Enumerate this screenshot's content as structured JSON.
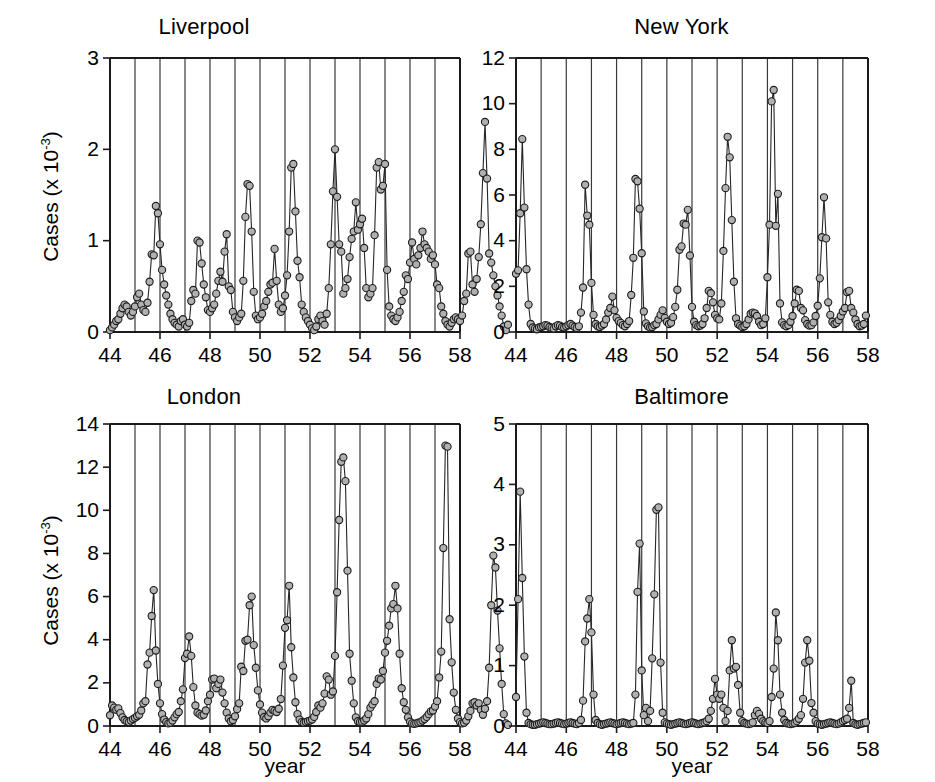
{
  "figure": {
    "background": "#ffffff",
    "marker_fill": "#b0b0b0",
    "marker_stroke": "#1c1c1c",
    "line_color": "#262626",
    "grid_color": "#3a3a3a"
  },
  "panels": [
    {
      "key": "liverpool",
      "title": "Liverpool",
      "ylabel_main": "Cases (x 10",
      "ylabel_exp": "-3",
      "ylabel_tail": ")",
      "xlabel": "",
      "show_ylabel": true,
      "show_xlabel": false
    },
    {
      "key": "newyork",
      "title": "New York",
      "ylabel_main": "",
      "ylabel_exp": "",
      "ylabel_tail": "",
      "xlabel": "",
      "show_ylabel": false,
      "show_xlabel": false
    },
    {
      "key": "london",
      "title": "London",
      "ylabel_main": "Cases (x 10",
      "ylabel_exp": "-3",
      "ylabel_tail": ")",
      "xlabel": "year",
      "show_ylabel": true,
      "show_xlabel": true
    },
    {
      "key": "baltimore",
      "title": "Baltimore",
      "ylabel_main": "",
      "ylabel_exp": "",
      "ylabel_tail": "",
      "xlabel": "year",
      "show_ylabel": false,
      "show_xlabel": true
    }
  ],
  "chart_data": [
    {
      "type": "line",
      "title": "Liverpool",
      "xlabel": "year",
      "ylabel": "Cases (x 10^-3)",
      "xlim": [
        44,
        58
      ],
      "ylim": [
        0,
        3
      ],
      "yticks": [
        0,
        1,
        2,
        3
      ],
      "xticks": [
        44,
        46,
        48,
        50,
        52,
        54,
        56,
        58
      ],
      "grid": "vertical gridlines at every year 44..58",
      "marker": "filled gray circle with dark outline",
      "x_start": 44.0,
      "x_step": 0.0833333,
      "values": [
        0.02,
        0.05,
        0.08,
        0.12,
        0.14,
        0.2,
        0.26,
        0.3,
        0.28,
        0.22,
        0.18,
        0.22,
        0.28,
        0.38,
        0.42,
        0.3,
        0.24,
        0.22,
        0.32,
        0.55,
        0.85,
        0.84,
        1.38,
        1.3,
        0.96,
        0.68,
        0.52,
        0.4,
        0.3,
        0.2,
        0.14,
        0.1,
        0.08,
        0.06,
        0.12,
        0.14,
        0.08,
        0.06,
        0.1,
        0.34,
        0.46,
        0.42,
        1.0,
        0.98,
        0.75,
        0.52,
        0.38,
        0.24,
        0.22,
        0.26,
        0.3,
        0.42,
        0.56,
        0.66,
        0.55,
        0.88,
        1.07,
        0.5,
        0.46,
        0.22,
        0.16,
        0.12,
        0.16,
        0.2,
        0.56,
        1.26,
        1.62,
        1.6,
        1.1,
        0.44,
        0.18,
        0.14,
        0.16,
        0.2,
        0.28,
        0.34,
        0.44,
        0.52,
        0.54,
        0.91,
        0.56,
        0.3,
        0.22,
        0.26,
        0.4,
        0.62,
        1.1,
        1.8,
        1.84,
        1.32,
        0.78,
        0.6,
        0.3,
        0.22,
        0.16,
        0.12,
        0.08,
        0.04,
        0.02,
        0.06,
        0.14,
        0.18,
        0.12,
        0.08,
        0.2,
        0.48,
        0.96,
        1.54,
        2.0,
        1.48,
        0.96,
        0.88,
        0.42,
        0.48,
        0.58,
        0.82,
        1.02,
        1.1,
        1.42,
        1.12,
        1.18,
        1.24,
        0.92,
        0.48,
        0.38,
        0.42,
        0.48,
        1.06,
        1.8,
        1.86,
        1.56,
        1.6,
        1.84,
        0.68,
        0.28,
        0.18,
        0.14,
        0.12,
        0.16,
        0.22,
        0.34,
        0.44,
        0.62,
        0.58,
        0.76,
        0.98,
        0.8,
        0.74,
        0.84,
        0.92,
        1.1,
        0.96,
        0.92,
        0.88,
        0.8,
        0.84,
        0.74,
        0.52,
        0.48,
        0.28,
        0.2,
        0.12,
        0.08,
        0.06,
        0.1,
        0.14,
        0.16,
        0.14,
        0.12,
        0.18,
        0.34,
        0.42,
        0.86,
        0.88,
        0.52,
        0.44,
        0.58,
        0.82,
        1.18,
        1.74,
        2.3,
        1.68,
        0.86,
        0.76,
        0.62,
        0.5,
        0.4,
        0.28,
        0.18,
        0.06,
        0.02,
        0.08
      ]
    },
    {
      "type": "line",
      "title": "New York",
      "xlabel": "year",
      "ylabel": "Cases (x 10^-3)",
      "xlim": [
        44,
        58
      ],
      "ylim": [
        0,
        12
      ],
      "yticks": [
        0,
        2,
        4,
        6,
        8,
        10,
        12
      ],
      "xticks": [
        44,
        46,
        48,
        50,
        52,
        54,
        56,
        58
      ],
      "grid": "vertical gridlines at every year 44..58",
      "marker": "filled gray circle with dark outline",
      "x_start": 44.0,
      "x_step": 0.0833333,
      "values": [
        2.55,
        2.7,
        5.2,
        8.45,
        5.45,
        2.75,
        1.2,
        0.35,
        0.2,
        0.15,
        0.12,
        0.2,
        0.22,
        0.25,
        0.3,
        0.28,
        0.22,
        0.18,
        0.15,
        0.25,
        0.3,
        0.28,
        0.22,
        0.2,
        0.25,
        0.3,
        0.35,
        0.28,
        0.22,
        0.18,
        0.25,
        0.85,
        1.95,
        6.45,
        5.1,
        4.7,
        2.15,
        0.75,
        0.35,
        0.25,
        0.22,
        0.28,
        0.35,
        0.55,
        0.85,
        1.05,
        1.55,
        0.95,
        0.62,
        0.48,
        0.4,
        0.3,
        0.25,
        0.35,
        0.48,
        1.62,
        3.25,
        6.7,
        6.6,
        5.4,
        3.45,
        0.9,
        0.38,
        0.25,
        0.2,
        0.22,
        0.3,
        0.35,
        0.55,
        0.75,
        0.95,
        0.62,
        0.45,
        0.35,
        0.4,
        0.65,
        1.1,
        1.85,
        3.6,
        3.75,
        4.75,
        4.7,
        5.35,
        3.35,
        1.1,
        0.45,
        0.3,
        0.25,
        0.28,
        0.35,
        0.6,
        1.05,
        1.8,
        1.7,
        1.3,
        0.75,
        0.6,
        0.55,
        1.25,
        3.55,
        6.3,
        8.55,
        7.65,
        4.9,
        2.2,
        0.6,
        0.35,
        0.28,
        0.22,
        0.25,
        0.35,
        0.55,
        0.8,
        0.85,
        0.82,
        0.7,
        0.45,
        0.3,
        0.35,
        0.6,
        2.4,
        4.7,
        10.1,
        10.6,
        4.65,
        6.05,
        1.25,
        0.42,
        0.3,
        0.25,
        0.3,
        0.45,
        0.7,
        1.25,
        1.85,
        1.8,
        1.05,
        0.95,
        0.52,
        0.35,
        0.28,
        0.3,
        0.42,
        0.7,
        1.15,
        2.35,
        4.15,
        5.9,
        4.1,
        1.3,
        0.75,
        0.45,
        0.35,
        0.4,
        0.52,
        0.7,
        0.9,
        1.05,
        1.75,
        1.8,
        1.05,
        0.85,
        0.55,
        0.35,
        0.25,
        0.28,
        0.35,
        0.72
      ]
    },
    {
      "type": "line",
      "title": "London",
      "xlabel": "year",
      "ylabel": "Cases (x 10^-3)",
      "xlim": [
        44,
        58
      ],
      "ylim": [
        0,
        14
      ],
      "yticks": [
        0,
        2,
        4,
        6,
        8,
        10,
        12,
        14
      ],
      "xticks": [
        44,
        46,
        48,
        50,
        52,
        54,
        56,
        58
      ],
      "grid": "vertical gridlines at every year 44..58",
      "marker": "filled gray circle with dark outline",
      "x_start": 44.0,
      "x_step": 0.0833333,
      "values": [
        0.5,
        0.95,
        0.85,
        0.75,
        0.82,
        0.6,
        0.4,
        0.28,
        0.22,
        0.18,
        0.25,
        0.32,
        0.38,
        0.45,
        0.52,
        0.72,
        1.05,
        1.15,
        2.85,
        3.4,
        5.1,
        6.3,
        3.5,
        1.95,
        1.05,
        0.55,
        0.3,
        0.18,
        0.12,
        0.15,
        0.25,
        0.4,
        0.55,
        0.65,
        1.15,
        1.7,
        3.15,
        3.35,
        4.15,
        3.25,
        1.8,
        0.95,
        0.62,
        0.55,
        0.48,
        0.52,
        0.72,
        1.15,
        1.45,
        2.15,
        2.2,
        1.75,
        1.95,
        2.15,
        1.55,
        1.05,
        0.62,
        0.35,
        0.22,
        0.28,
        0.45,
        0.78,
        1.05,
        2.75,
        2.55,
        3.95,
        4.0,
        5.6,
        6.0,
        3.75,
        2.7,
        1.65,
        1.0,
        0.62,
        0.42,
        0.35,
        0.45,
        0.62,
        0.75,
        0.7,
        0.65,
        0.8,
        1.25,
        2.8,
        4.55,
        4.9,
        6.5,
        3.65,
        2.25,
        1.1,
        0.55,
        0.3,
        0.18,
        0.15,
        0.18,
        0.22,
        0.25,
        0.3,
        0.42,
        0.65,
        0.95,
        0.85,
        1.05,
        1.5,
        2.3,
        2.15,
        1.45,
        1.6,
        3.25,
        6.2,
        9.55,
        12.25,
        12.45,
        11.35,
        7.2,
        3.35,
        2.1,
        1.05,
        0.4,
        0.22,
        0.18,
        0.2,
        0.25,
        0.35,
        0.55,
        0.85,
        1.0,
        1.15,
        1.95,
        2.2,
        2.15,
        2.55,
        3.4,
        3.95,
        4.65,
        5.45,
        5.65,
        6.5,
        5.45,
        3.35,
        1.75,
        1.1,
        0.75,
        0.4,
        0.2,
        0.12,
        0.1,
        0.12,
        0.15,
        0.18,
        0.25,
        0.32,
        0.42,
        0.55,
        0.68,
        0.72,
        0.9,
        1.15,
        2.25,
        3.45,
        8.25,
        13.0,
        12.95,
        4.95,
        2.95,
        1.55,
        0.75,
        0.35,
        0.18,
        0.12,
        0.15,
        0.25,
        0.45,
        0.7,
        1.05,
        1.1,
        0.95,
        1.05,
        0.75,
        0.52,
        0.8,
        1.15,
        2.7,
        5.6,
        7.9,
        7.35,
        5.35,
        3.6,
        1.95,
        0.55,
        0.12,
        0.05
      ]
    },
    {
      "type": "line",
      "title": "Baltimore",
      "xlabel": "year",
      "ylabel": "Cases (x 10^-3)",
      "xlim": [
        44,
        58
      ],
      "ylim": [
        0,
        5
      ],
      "yticks": [
        0,
        1,
        2,
        3,
        4,
        5
      ],
      "xticks": [
        44,
        46,
        48,
        50,
        52,
        54,
        56,
        58
      ],
      "grid": "vertical gridlines at every year 44..58",
      "marker": "filled gray circle with dark outline",
      "x_start": 44.0,
      "x_step": 0.0833333,
      "values": [
        0.48,
        2.1,
        3.88,
        2.45,
        1.15,
        0.22,
        0.05,
        0.03,
        0.02,
        0.02,
        0.03,
        0.04,
        0.05,
        0.06,
        0.05,
        0.04,
        0.03,
        0.03,
        0.04,
        0.05,
        0.06,
        0.05,
        0.04,
        0.03,
        0.04,
        0.05,
        0.06,
        0.05,
        0.04,
        0.03,
        0.05,
        0.1,
        0.42,
        1.4,
        1.78,
        2.1,
        1.55,
        0.52,
        0.1,
        0.05,
        0.03,
        0.02,
        0.03,
        0.04,
        0.05,
        0.06,
        0.05,
        0.04,
        0.03,
        0.04,
        0.05,
        0.06,
        0.05,
        0.04,
        0.03,
        0.04,
        0.05,
        0.52,
        2.22,
        3.02,
        0.92,
        0.18,
        0.3,
        0.08,
        0.25,
        1.12,
        2.18,
        3.58,
        3.62,
        1.05,
        0.22,
        0.06,
        0.04,
        0.03,
        0.02,
        0.03,
        0.04,
        0.05,
        0.06,
        0.05,
        0.04,
        0.03,
        0.04,
        0.05,
        0.06,
        0.05,
        0.04,
        0.03,
        0.04,
        0.05,
        0.06,
        0.08,
        0.12,
        0.25,
        0.45,
        0.78,
        0.52,
        0.45,
        0.52,
        0.3,
        0.08,
        0.25,
        0.92,
        1.42,
        0.95,
        0.98,
        0.68,
        0.22,
        0.08,
        0.05,
        0.04,
        0.03,
        0.04,
        0.06,
        0.18,
        0.25,
        0.2,
        0.12,
        0.08,
        0.06,
        0.05,
        0.08,
        0.48,
        0.95,
        1.88,
        1.42,
        0.52,
        0.22,
        0.1,
        0.05,
        0.04,
        0.03,
        0.04,
        0.05,
        0.08,
        0.12,
        0.18,
        0.45,
        1.05,
        1.42,
        1.08,
        0.38,
        0.22,
        0.08,
        0.04,
        0.03,
        0.02,
        0.03,
        0.04,
        0.05,
        0.06,
        0.05,
        0.04,
        0.03,
        0.04,
        0.06,
        0.08,
        0.1,
        0.12,
        0.3,
        0.75,
        0.05,
        0.03,
        0.02,
        0.03,
        0.04,
        0.05,
        0.06
      ]
    }
  ]
}
